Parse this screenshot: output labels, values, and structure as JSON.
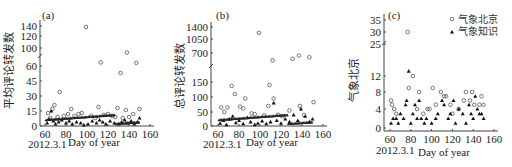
{
  "figure": {
    "panels": [
      {
        "id": "a",
        "tag": "(a)",
        "ylabel": "平均评论转发数",
        "xlabel": "Day of year",
        "start_date": "2012.3.1"
      },
      {
        "id": "b",
        "tag": "(b)",
        "ylabel": "总评论转发数",
        "xlabel": "Day of year",
        "start_date": "2012.3.1"
      },
      {
        "id": "c",
        "tag": "(c)",
        "ylabel": "气象北京",
        "xlabel": "Day of year",
        "start_date": "2012.3.1"
      }
    ],
    "legend": [
      {
        "label": "气象北京",
        "marker": "circle"
      },
      {
        "label": "气象知识",
        "marker": "triangle"
      }
    ]
  },
  "chart_data": [
    {
      "type": "scatter",
      "title": "(a)",
      "xlabel": "Day of year",
      "ylabel": "平均评论转发数",
      "x_ticks": [
        60,
        80,
        100,
        120,
        140,
        160
      ],
      "y_ticks": [
        0,
        15,
        30,
        45,
        60,
        100,
        120,
        140
      ],
      "y_axis_break": "between 60 and 100",
      "xlim": [
        55,
        160
      ],
      "note": "2012.3.1 marks day 60",
      "series": [
        {
          "name": "气象北京",
          "marker": "circle",
          "points": [
            [
              63,
              13
            ],
            [
              67,
              17
            ],
            [
              69,
              21
            ],
            [
              74,
              34
            ],
            [
              85,
              17
            ],
            [
              99,
              138
            ],
            [
              111,
              19
            ],
            [
              113,
              68
            ],
            [
              129,
              18
            ],
            [
              132,
              53
            ],
            [
              137,
              16
            ],
            [
              138,
              90
            ],
            [
              147,
              67
            ],
            [
              150,
              17
            ],
            [
              65,
              8
            ],
            [
              72,
              9
            ],
            [
              78,
              10
            ],
            [
              82,
              12
            ],
            [
              88,
              10
            ],
            [
              92,
              12
            ],
            [
              95,
              13
            ],
            [
              104,
              10
            ],
            [
              108,
              8
            ],
            [
              116,
              11
            ],
            [
              120,
              12
            ],
            [
              124,
              10
            ],
            [
              127,
              9
            ],
            [
              134,
              8
            ],
            [
              140,
              9
            ],
            [
              144,
              12
            ]
          ]
        },
        {
          "name": "气象知识",
          "marker": "triangle",
          "points": [
            [
              62,
              3
            ],
            [
              64,
              7
            ],
            [
              66,
              15
            ],
            [
              68,
              5
            ],
            [
              70,
              2
            ],
            [
              73,
              4
            ],
            [
              76,
              6
            ],
            [
              80,
              3
            ],
            [
              83,
              5
            ],
            [
              86,
              2
            ],
            [
              90,
              4
            ],
            [
              94,
              3
            ],
            [
              97,
              1
            ],
            [
              101,
              2
            ],
            [
              105,
              5
            ],
            [
              109,
              3
            ],
            [
              112,
              6
            ],
            [
              115,
              4
            ],
            [
              118,
              2
            ],
            [
              122,
              5
            ],
            [
              126,
              3
            ],
            [
              130,
              2
            ],
            [
              133,
              4
            ],
            [
              136,
              6
            ],
            [
              139,
              3
            ],
            [
              142,
              5
            ],
            [
              145,
              2
            ],
            [
              148,
              4
            ],
            [
              150,
              8
            ]
          ]
        }
      ]
    },
    {
      "type": "scatter",
      "title": "(b)",
      "xlabel": "Day of year",
      "ylabel": "总评论转发数",
      "x_ticks": [
        60,
        80,
        100,
        120,
        140,
        160
      ],
      "y_ticks": [
        0,
        50,
        100,
        150,
        700,
        1050,
        1400
      ],
      "y_axis_break": "between 150 and 700",
      "xlim": [
        55,
        160
      ],
      "note": "2012.3.1 marks day 60",
      "series": [
        {
          "name": "气象北京",
          "marker": "circle",
          "points": [
            [
              63,
              65
            ],
            [
              66,
              50
            ],
            [
              69,
              65
            ],
            [
              73,
              137
            ],
            [
              76,
              110
            ],
            [
              81,
              68
            ],
            [
              86,
              95
            ],
            [
              99,
              1230
            ],
            [
              109,
              140
            ],
            [
              112,
              560
            ],
            [
              113,
              95
            ],
            [
              131,
              590
            ],
            [
              137,
              650
            ],
            [
              147,
              620
            ],
            [
              151,
              83
            ],
            [
              84,
              62
            ],
            [
              92,
              45
            ],
            [
              95,
              42
            ],
            [
              104,
              38
            ],
            [
              108,
              70
            ],
            [
              117,
              40
            ],
            [
              121,
              35
            ],
            [
              128,
              55
            ],
            [
              138,
              70
            ],
            [
              142,
              40
            ]
          ]
        },
        {
          "name": "气象知识",
          "marker": "triangle",
          "points": [
            [
              62,
              10
            ],
            [
              65,
              20
            ],
            [
              68,
              5
            ],
            [
              71,
              25
            ],
            [
              74,
              35
            ],
            [
              77,
              12
            ],
            [
              80,
              20
            ],
            [
              84,
              8
            ],
            [
              88,
              30
            ],
            [
              91,
              15
            ],
            [
              95,
              5
            ],
            [
              98,
              10
            ],
            [
              102,
              18
            ],
            [
              106,
              8
            ],
            [
              110,
              15
            ],
            [
              113,
              80
            ],
            [
              116,
              20
            ],
            [
              120,
              10
            ],
            [
              124,
              25
            ],
            [
              128,
              15
            ],
            [
              132,
              40
            ],
            [
              136,
              20
            ],
            [
              139,
              60
            ],
            [
              143,
              35
            ],
            [
              147,
              15
            ],
            [
              150,
              25
            ]
          ]
        }
      ]
    },
    {
      "type": "scatter",
      "title": "(c)",
      "xlabel": "Day of year",
      "ylabel": "气象北京",
      "x_ticks": [
        60,
        80,
        100,
        120,
        140,
        160
      ],
      "y_ticks": [
        0,
        4,
        8,
        12,
        25,
        30,
        35
      ],
      "y_axis_break": "between 12 and 25",
      "xlim": [
        55,
        160
      ],
      "legend_position": "upper right",
      "note": "2012.3.1 marks day 60",
      "series": [
        {
          "name": "气象北京",
          "marker": "circle",
          "points": [
            [
              61,
              6
            ],
            [
              62,
              5
            ],
            [
              64,
              4
            ],
            [
              66,
              3
            ],
            [
              77,
              30
            ],
            [
              78,
              9
            ],
            [
              82,
              12
            ],
            [
              88,
              8
            ],
            [
              86,
              4
            ],
            [
              92,
              3
            ],
            [
              96,
              4
            ],
            [
              98,
              4
            ],
            [
              101,
              9
            ],
            [
              104,
              5
            ],
            [
              109,
              8
            ],
            [
              112,
              7
            ],
            [
              114,
              7
            ],
            [
              118,
              5
            ],
            [
              120,
              3
            ],
            [
              126,
              4
            ],
            [
              131,
              6
            ],
            [
              133,
              8
            ],
            [
              137,
              6
            ],
            [
              139,
              8
            ],
            [
              141,
              5
            ],
            [
              146,
              5
            ],
            [
              148,
              7
            ],
            [
              150,
              5
            ]
          ]
        },
        {
          "name": "气象知识",
          "marker": "triangle",
          "points": [
            [
              61,
              1
            ],
            [
              63,
              2
            ],
            [
              66,
              2
            ],
            [
              68,
              1
            ],
            [
              70,
              3
            ],
            [
              73,
              2
            ],
            [
              75,
              5
            ],
            [
              76,
              6
            ],
            [
              78,
              14
            ],
            [
              80,
              1
            ],
            [
              82,
              3
            ],
            [
              84,
              5
            ],
            [
              86,
              2
            ],
            [
              88,
              6
            ],
            [
              90,
              2
            ],
            [
              93,
              1
            ],
            [
              95,
              2
            ],
            [
              100,
              1
            ],
            [
              104,
              2
            ],
            [
              106,
              3
            ],
            [
              110,
              6
            ],
            [
              112,
              5
            ],
            [
              116,
              2
            ],
            [
              118,
              3
            ],
            [
              121,
              6
            ],
            [
              123,
              1
            ],
            [
              126,
              4
            ],
            [
              130,
              3
            ],
            [
              133,
              1
            ],
            [
              136,
              5
            ],
            [
              138,
              3
            ],
            [
              140,
              2
            ],
            [
              142,
              7
            ],
            [
              144,
              4
            ],
            [
              146,
              3
            ],
            [
              148,
              3
            ],
            [
              150,
              2
            ]
          ]
        }
      ]
    }
  ]
}
